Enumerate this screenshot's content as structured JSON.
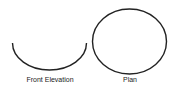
{
  "diagram": {
    "views": [
      {
        "id": "front-elevation",
        "label": "Front Elevation",
        "shape": "semicircle-arc"
      },
      {
        "id": "plan",
        "label": "Plan",
        "shape": "circle"
      }
    ],
    "stroke_color": "#222222"
  }
}
